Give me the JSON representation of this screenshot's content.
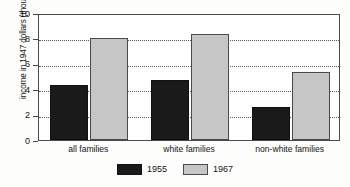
{
  "chart_data": {
    "type": "bar",
    "title": "",
    "xlabel": "",
    "ylabel": "income in 1947 dollars (thousands)",
    "ylim": [
      0,
      10
    ],
    "yticks": [
      0,
      2,
      4,
      6,
      8,
      10
    ],
    "ytick_labels": [
      "0",
      "2",
      "4",
      "6",
      "8",
      "10"
    ],
    "grid": "horizontal-dotted",
    "legend_position": "bottom-center",
    "categories": [
      "all families",
      "white families",
      "non-white families"
    ],
    "series": [
      {
        "name": "1955",
        "color": "#1a1a1a",
        "values": [
          4.3,
          4.75,
          2.6
        ]
      },
      {
        "name": "1967",
        "color": "#c6c6c6",
        "values": [
          8.05,
          8.35,
          5.35
        ]
      }
    ]
  },
  "legend": {
    "items": [
      {
        "label": "1955"
      },
      {
        "label": "1967"
      }
    ]
  }
}
